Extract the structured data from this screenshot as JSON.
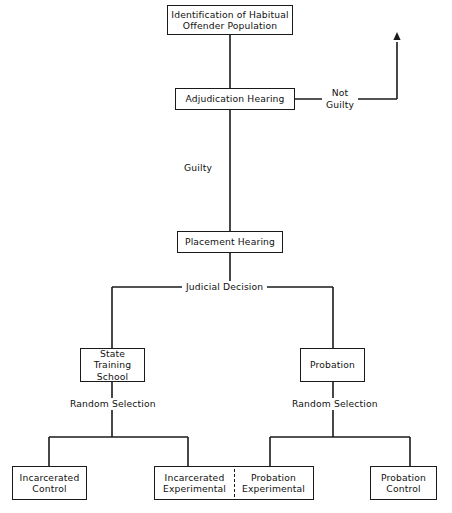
{
  "diagram": {
    "type": "flowchart",
    "line_color": "#1a1a1a",
    "text_color": "#111111",
    "background": "#ffffff",
    "nodes": [
      {
        "id": "identification",
        "label": "Identification of Habitual\nOffender Population",
        "x": 167,
        "y": 5,
        "w": 126,
        "h": 30
      },
      {
        "id": "adjudication",
        "label": "Adjudication Hearing",
        "x": 175,
        "y": 88,
        "w": 120,
        "h": 22
      },
      {
        "id": "placement",
        "label": "Placement Hearing",
        "x": 177,
        "y": 231,
        "w": 106,
        "h": 22
      },
      {
        "id": "state-training-school",
        "label": "State Training\nSchool",
        "x": 80,
        "y": 348,
        "w": 65,
        "h": 34
      },
      {
        "id": "probation",
        "label": "Probation",
        "x": 300,
        "y": 348,
        "w": 65,
        "h": 34
      },
      {
        "id": "incarcerated-control",
        "label": "Incarcerated\nControl",
        "x": 12,
        "y": 466,
        "w": 75,
        "h": 34
      },
      {
        "id": "incarcerated-experimental",
        "label": "Incarcerated\nExperimental",
        "x": 154,
        "y": 466,
        "w": 80,
        "h": 34
      },
      {
        "id": "probation-experimental",
        "label": "Probation\nExperimental",
        "x": 234,
        "y": 466,
        "w": 80,
        "h": 34
      },
      {
        "id": "probation-control",
        "label": "Probation\nControl",
        "x": 370,
        "y": 466,
        "w": 67,
        "h": 34
      }
    ],
    "edge_labels": [
      {
        "id": "not-guilty",
        "label": "Not\nGuilty",
        "x": 322,
        "y": 87
      },
      {
        "id": "guilty",
        "label": "Guilty",
        "x": 180,
        "y": 162
      },
      {
        "id": "judicial-decision",
        "label": "Judicial Decision",
        "x": 182,
        "y": 281
      },
      {
        "id": "random-selection-left",
        "label": "Random Selection",
        "x": 66,
        "y": 398
      },
      {
        "id": "random-selection-right",
        "label": "Random Selection",
        "x": 288,
        "y": 398
      }
    ],
    "connectors": [
      {
        "id": "identification-to-adjudication",
        "path": "M 230 35 L 230 88"
      },
      {
        "id": "adjudication-to-not-guilty",
        "path": "M 295 99 L 397 99"
      },
      {
        "id": "not-guilty-arrow-riser",
        "path": "M 397 99 L 397 42"
      },
      {
        "id": "adjudication-to-placement",
        "path": "M 230 110 L 230 231"
      },
      {
        "id": "placement-to-judicial",
        "path": "M 230 253 L 230 287"
      },
      {
        "id": "judicial-horizontal",
        "path": "M 112 287 L 333 287"
      },
      {
        "id": "judicial-to-state-training",
        "path": "M 112 287 L 112 348"
      },
      {
        "id": "judicial-to-probation",
        "path": "M 333 287 L 333 348"
      },
      {
        "id": "state-training-to-selection",
        "path": "M 112 382 L 112 437"
      },
      {
        "id": "probation-to-selection",
        "path": "M 333 382 L 333 437"
      },
      {
        "id": "left-split-bar",
        "path": "M 49 437 L 188 437"
      },
      {
        "id": "left-split-to-control",
        "path": "M 49 437 L 49 466"
      },
      {
        "id": "left-split-to-experimental",
        "path": "M 188 437 L 188 466"
      },
      {
        "id": "right-split-bar",
        "path": "M 270 437 L 410 437"
      },
      {
        "id": "right-split-to-experimental",
        "path": "M 270 437 L 270 466"
      },
      {
        "id": "right-split-to-control",
        "path": "M 410 437 L 410 466"
      }
    ],
    "arrowheads": [
      {
        "id": "not-guilty-exit-arrow",
        "x": 397,
        "y": 40,
        "direction": "up"
      }
    ],
    "dividers": [
      {
        "id": "experimental-group-divider",
        "x": 234,
        "y": 469,
        "h": 28
      }
    ]
  }
}
